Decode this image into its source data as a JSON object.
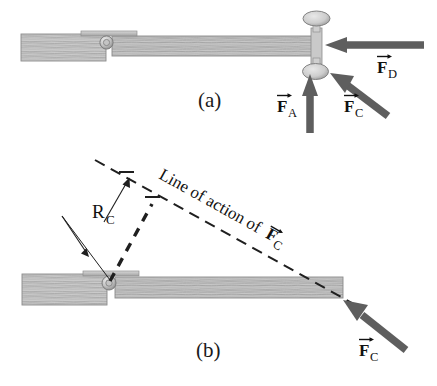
{
  "figure": {
    "panels": [
      {
        "id": "a",
        "label": "(a)",
        "description": "Top view of a door on a hinge with three applied forces at the knob",
        "labels": [
          {
            "name": "F_A",
            "symbol": "F",
            "subscript": "A",
            "vector": true
          },
          {
            "name": "F_C",
            "symbol": "F",
            "subscript": "C",
            "vector": true
          },
          {
            "name": "F_D",
            "symbol": "F",
            "subscript": "D",
            "vector": true
          }
        ]
      },
      {
        "id": "b",
        "label": "(b)",
        "description": "Top view of door showing the line of action of F_C and moment arm R_C",
        "labels": [
          {
            "name": "R_C",
            "symbol": "R",
            "subscript": "C",
            "vector": false
          },
          {
            "name": "F_C",
            "symbol": "F",
            "subscript": "C",
            "vector": true
          }
        ],
        "annotation": {
          "name": "line-of-action",
          "text_plain": "Line of action of",
          "text_symbol": "F",
          "text_subscript": "C",
          "vector": true
        }
      }
    ],
    "colors": {
      "wood_fill": "#c9c9c9",
      "wood_grain": "#9a9a9a",
      "wood_edge": "#8a8a8a",
      "arrow": "#5a5a5a",
      "dash_line": "#1f1f1f",
      "text": "#111111",
      "background": "#ffffff",
      "knob_fill": "#d2d2d2"
    }
  }
}
